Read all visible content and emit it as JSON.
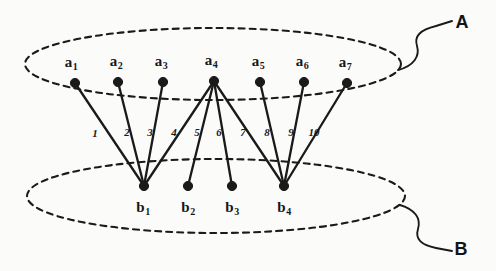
{
  "figure": {
    "ink_color": "#1a1a1a",
    "background_color": "#fbfbfa"
  },
  "sets": [
    {
      "name": "set-a",
      "label": "A",
      "label_x": 462,
      "label_y": 22,
      "ellipse": {
        "cx": 213,
        "cy": 64,
        "rx": 188,
        "ry": 36
      },
      "leader_path": "M 398,70 C 414,66 420,56 417,46 C 414,36 420,30 436,26 L 452,21"
    },
    {
      "name": "set-b",
      "label": "B",
      "label_x": 461,
      "label_y": 249,
      "ellipse": {
        "cx": 216,
        "cy": 196,
        "rx": 189,
        "ry": 37
      },
      "leader_path": "M 400,205 C 416,210 421,219 418,229 C 415,239 421,245 436,248 L 452,251"
    }
  ],
  "nodes_a": [
    {
      "name": "node-a1",
      "label": "a",
      "sub": "1",
      "x": 75,
      "y": 83,
      "label_x": 71,
      "label_y": 62
    },
    {
      "name": "node-a2",
      "label": "a",
      "sub": "2",
      "x": 118,
      "y": 82,
      "label_x": 116,
      "label_y": 61
    },
    {
      "name": "node-a3",
      "label": "a",
      "sub": "3",
      "x": 163,
      "y": 82,
      "label_x": 161,
      "label_y": 61
    },
    {
      "name": "node-a4",
      "label": "a",
      "sub": "4",
      "x": 214,
      "y": 81,
      "label_x": 211,
      "label_y": 60
    },
    {
      "name": "node-a5",
      "label": "a",
      "sub": "5",
      "x": 260,
      "y": 82,
      "label_x": 258,
      "label_y": 61
    },
    {
      "name": "node-a6",
      "label": "a",
      "sub": "6",
      "x": 304,
      "y": 82,
      "label_x": 302,
      "label_y": 61
    },
    {
      "name": "node-a7",
      "label": "a",
      "sub": "7",
      "x": 347,
      "y": 83,
      "label_x": 345,
      "label_y": 62
    }
  ],
  "nodes_b": [
    {
      "name": "node-b1",
      "label": "b",
      "sub": "1",
      "x": 144,
      "y": 186,
      "label_x": 143,
      "label_y": 207
    },
    {
      "name": "node-b2",
      "label": "b",
      "sub": "2",
      "x": 188,
      "y": 186,
      "label_x": 188,
      "label_y": 207
    },
    {
      "name": "node-b3",
      "label": "b",
      "sub": "3",
      "x": 232,
      "y": 186,
      "label_x": 232,
      "label_y": 207
    },
    {
      "name": "node-b4",
      "label": "b",
      "sub": "4",
      "x": 284,
      "y": 186,
      "label_x": 284,
      "label_y": 207
    }
  ],
  "edges": [
    {
      "name": "edge-a1-b1",
      "from": "a1",
      "to": "b1",
      "x1": 75,
      "y1": 83,
      "x2": 144,
      "y2": 186,
      "label": "1",
      "label_x": 95,
      "label_y": 133
    },
    {
      "name": "edge-a2-b1",
      "from": "a2",
      "to": "b1",
      "x1": 118,
      "y1": 82,
      "x2": 144,
      "y2": 186,
      "label": "2",
      "label_x": 127,
      "label_y": 132
    },
    {
      "name": "edge-a3-b1",
      "from": "a3",
      "to": "b1",
      "x1": 163,
      "y1": 82,
      "x2": 144,
      "y2": 186,
      "label": "3",
      "label_x": 150,
      "label_y": 132
    },
    {
      "name": "edge-a4-b1",
      "from": "a4",
      "to": "b1",
      "x1": 214,
      "y1": 81,
      "x2": 144,
      "y2": 186,
      "label": "4",
      "label_x": 174,
      "label_y": 132
    },
    {
      "name": "edge-a4-b2",
      "from": "a4",
      "to": "b2",
      "x1": 214,
      "y1": 81,
      "x2": 188,
      "y2": 186,
      "label": "5",
      "label_x": 197,
      "label_y": 132
    },
    {
      "name": "edge-a4-b3",
      "from": "a4",
      "to": "b3",
      "x1": 214,
      "y1": 81,
      "x2": 232,
      "y2": 186,
      "label": "6",
      "label_x": 219,
      "label_y": 132
    },
    {
      "name": "edge-a4-b4",
      "from": "a4",
      "to": "b4",
      "x1": 214,
      "y1": 81,
      "x2": 284,
      "y2": 186,
      "label": "7",
      "label_x": 243,
      "label_y": 132
    },
    {
      "name": "edge-a5-b4",
      "from": "a5",
      "to": "b4",
      "x1": 260,
      "y1": 82,
      "x2": 284,
      "y2": 186,
      "label": "8",
      "label_x": 267,
      "label_y": 132
    },
    {
      "name": "edge-a6-b4",
      "from": "a6",
      "to": "b4",
      "x1": 304,
      "y1": 82,
      "x2": 284,
      "y2": 186,
      "label": "9",
      "label_x": 291,
      "label_y": 132
    },
    {
      "name": "edge-a7-b4",
      "from": "a7",
      "to": "b4",
      "x1": 347,
      "y1": 83,
      "x2": 284,
      "y2": 186,
      "label": "10",
      "label_x": 314,
      "label_y": 132
    }
  ]
}
